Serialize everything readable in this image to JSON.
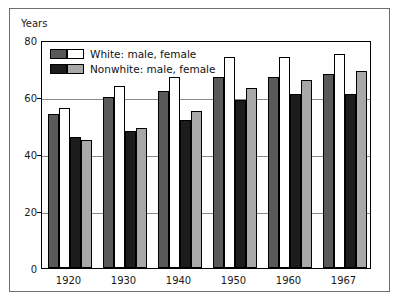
{
  "chart_data": {
    "type": "bar",
    "title": "",
    "xlabel": "",
    "ylabel": "Years",
    "ylim": [
      0,
      80
    ],
    "yticks": [
      0,
      20,
      40,
      60,
      80
    ],
    "grid": true,
    "legend_position": "upper-left",
    "categories": [
      "1920",
      "1930",
      "1940",
      "1950",
      "1960",
      "1967"
    ],
    "series": [
      {
        "name": "White: male",
        "color": "#595959",
        "values": [
          54,
          60,
          62,
          67,
          67,
          68
        ]
      },
      {
        "name": "White: female",
        "color": "#ffffff",
        "values": [
          56,
          64,
          67,
          74,
          74,
          75
        ]
      },
      {
        "name": "Nonwhite: male",
        "color": "#1c1c1c",
        "values": [
          46,
          48,
          52,
          59,
          61,
          61
        ]
      },
      {
        "name": "Nonwhite: female",
        "color": "#a8a8a8",
        "values": [
          45,
          49,
          55,
          63,
          66,
          69
        ]
      }
    ],
    "legend_entries": [
      {
        "label": "White: male, female",
        "swatches": [
          "#595959",
          "#ffffff"
        ]
      },
      {
        "label": "Nonwhite: male, female",
        "swatches": [
          "#1c1c1c",
          "#a8a8a8"
        ]
      }
    ]
  }
}
